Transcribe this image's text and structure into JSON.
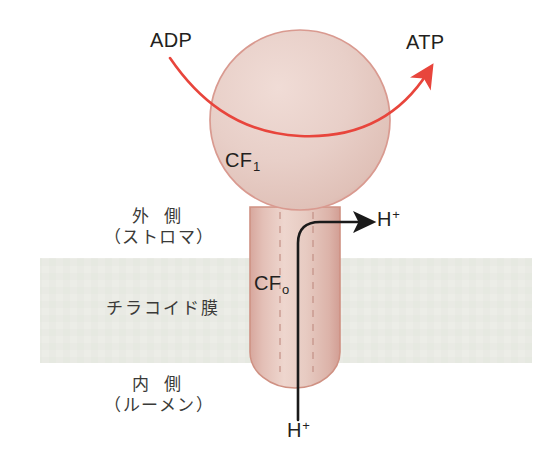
{
  "diagram": {
    "background_color": "#ffffff"
  },
  "colors": {
    "membrane_band": "#e9eae4",
    "protein_fill": "#e8cfc8",
    "protein_outline": "#d99a90",
    "red_arrow": "#e8453c",
    "black_arrow": "#1a1a1a",
    "text": "#231f20"
  },
  "labels": {
    "adp": "ADP",
    "atp": "ATP",
    "cf1_base": "CF",
    "cf1_sub": "1",
    "cf0_base": "CF",
    "cf0_sub": "o",
    "proton_out_base": "H",
    "proton_out_sup": "+",
    "proton_in_base": "H",
    "proton_in_sup": "+",
    "outer_line1": "外 側",
    "outer_line2": "（ストロマ）",
    "membrane": "チラコイド膜",
    "inner_line1": "内 側",
    "inner_line2": "（ルーメン）"
  },
  "geometry": {
    "membrane_band": {
      "x": 40,
      "y": 258,
      "width": 492,
      "height": 105
    },
    "cf1_sphere": {
      "cx": 300,
      "cy": 120,
      "r": 90
    },
    "cf0_cylinder": {
      "x": 250,
      "y": 205,
      "width": 90,
      "height": 183
    }
  }
}
